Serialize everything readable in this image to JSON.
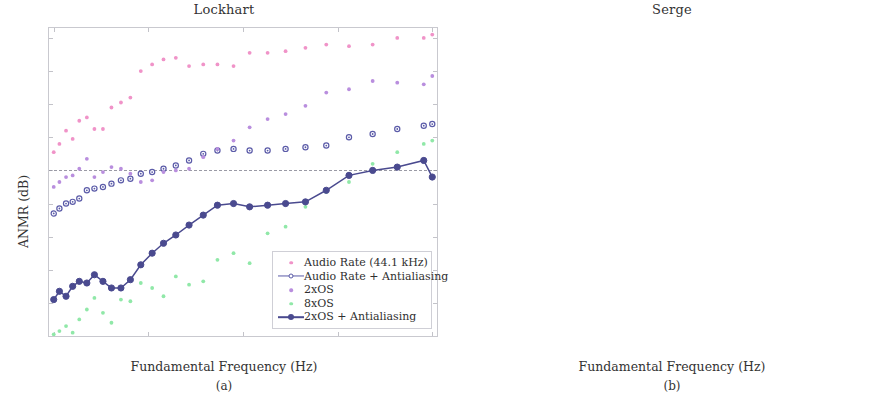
{
  "figure": {
    "panels": [
      {
        "id": "a",
        "title": "Lockhart",
        "subcaption": "(a)",
        "xlabel": "Fundamental Frequency (Hz)",
        "ylabel": "ANMR (dB)"
      },
      {
        "id": "b",
        "title": "Serge",
        "subcaption": "(b)",
        "xlabel": "Fundamental Frequency (Hz)",
        "ylabel": "ANMR (dB)"
      }
    ]
  },
  "colors": {
    "audio_rate": "#f093c8",
    "audio_rate_aa": "#5b5ba8",
    "os2": "#b98ede",
    "os8": "#90e8a8",
    "os2_aa": "#4a4a8f",
    "axis": "#c9c9cf",
    "refline": "#9a9aa5",
    "text": "#333333"
  },
  "chart_data": [
    {
      "type": "scatter",
      "title": "Lockhart",
      "subcaption": "(a)",
      "xlabel": "Fundamental Frequency (Hz)",
      "ylabel": "ANMR (dB)",
      "xlim": [
        950,
        5050
      ],
      "ylim": [
        -60,
        33
      ],
      "xticks": [
        1000,
        2000,
        3000,
        4000,
        5000
      ],
      "xticklabels": [
        "1k",
        "2k",
        "3k",
        "4k",
        "5k"
      ],
      "yticks": [
        -60,
        -50,
        -40,
        -30,
        -20,
        -10,
        0,
        10,
        20,
        30
      ],
      "yticklabels": [
        "-60",
        "-50",
        "-40",
        "-30",
        "-20",
        "-10",
        "0",
        "10",
        "20",
        "30"
      ],
      "grid": false,
      "reference_line": {
        "y": -10,
        "style": "dashed",
        "label": ""
      },
      "legend_position": "lower-right",
      "series": [
        {
          "name": "Audio Rate (44.1 kHz)",
          "marker": "dot",
          "line": false,
          "color": "#f093c8",
          "x": [
            1000,
            1060,
            1130,
            1200,
            1270,
            1350,
            1430,
            1520,
            1610,
            1710,
            1810,
            1920,
            2040,
            2160,
            2290,
            2430,
            2580,
            2730,
            2900,
            3070,
            3260,
            3450,
            3660,
            3880,
            4120,
            4370,
            4630,
            4910,
            5000
          ],
          "y": [
            -4.5,
            -2.0,
            2.0,
            -0.5,
            5.0,
            6.0,
            2.5,
            2.5,
            9.0,
            10.5,
            12.0,
            20.0,
            22.0,
            23.5,
            24.0,
            21.5,
            22.0,
            22.0,
            21.5,
            25.5,
            25.5,
            26.0,
            27.0,
            28.0,
            27.5,
            28.0,
            30.0,
            30.0,
            31.0
          ]
        },
        {
          "name": "Audio Rate + Antialiasing",
          "marker": "circle-open",
          "line": false,
          "color": "#5b5ba8",
          "x": [
            1000,
            1060,
            1130,
            1200,
            1270,
            1350,
            1430,
            1520,
            1610,
            1710,
            1810,
            1920,
            2040,
            2160,
            2290,
            2430,
            2580,
            2730,
            2900,
            3070,
            3260,
            3450,
            3660,
            3880,
            4120,
            4370,
            4630,
            4910,
            5000
          ],
          "y": [
            -23.0,
            -21.5,
            -20.0,
            -19.5,
            -18.5,
            -16.0,
            -15.5,
            -15.0,
            -14.0,
            -13.0,
            -12.5,
            -11.0,
            -10.5,
            -9.5,
            -8.5,
            -7.0,
            -5.0,
            -4.0,
            -3.5,
            -4.0,
            -4.0,
            -3.5,
            -3.0,
            -2.5,
            0.0,
            1.0,
            2.5,
            3.5,
            4.0
          ]
        },
        {
          "name": "2xOS",
          "marker": "dot",
          "line": false,
          "color": "#b98ede",
          "x": [
            1000,
            1060,
            1130,
            1200,
            1270,
            1350,
            1430,
            1520,
            1610,
            1710,
            1810,
            1920,
            2040,
            2160,
            2290,
            2430,
            2580,
            2730,
            2900,
            3070,
            3260,
            3450,
            3660,
            3880,
            4120,
            4370,
            4630,
            4910,
            5000
          ],
          "y": [
            -15.0,
            -13.5,
            -12.0,
            -11.5,
            -9.5,
            -6.5,
            -12.0,
            -10.5,
            -9.0,
            -9.5,
            -11.0,
            -13.5,
            -13.0,
            -10.5,
            -10.0,
            -9.5,
            -6.0,
            -3.5,
            -1.0,
            3.0,
            5.5,
            7.0,
            9.5,
            13.5,
            14.5,
            17.0,
            16.5,
            16.0,
            18.5
          ]
        },
        {
          "name": "8xOS",
          "marker": "dot",
          "line": false,
          "color": "#90e8a8",
          "x": [
            1000,
            1060,
            1130,
            1200,
            1270,
            1350,
            1430,
            1520,
            1610,
            1710,
            1810,
            1920,
            2040,
            2160,
            2290,
            2430,
            2580,
            2730,
            2900,
            3070,
            3260,
            3450,
            3660,
            3880,
            4120,
            4370,
            4630,
            4910,
            5000
          ],
          "y": [
            -59.5,
            -58.5,
            -57.0,
            -59.0,
            -55.0,
            -52.0,
            -48.5,
            -53.0,
            -56.0,
            -49.0,
            -49.5,
            -44.0,
            -45.5,
            -48.0,
            -42.0,
            -44.5,
            -43.5,
            -37.0,
            -35.0,
            -38.0,
            -29.0,
            -27.0,
            -21.0,
            -16.5,
            -13.5,
            -8.0,
            -4.5,
            -2.0,
            -1.0
          ]
        },
        {
          "name": "2xOS + Antialiasing",
          "marker": "circle-filled",
          "line": true,
          "color": "#4a4a8f",
          "x": [
            1000,
            1060,
            1130,
            1200,
            1270,
            1350,
            1430,
            1520,
            1610,
            1710,
            1810,
            1920,
            2040,
            2160,
            2290,
            2430,
            2580,
            2730,
            2900,
            3070,
            3260,
            3450,
            3660,
            3880,
            4120,
            4370,
            4630,
            4910,
            5000
          ],
          "y": [
            -49.0,
            -46.5,
            -48.0,
            -45.0,
            -43.5,
            -44.0,
            -41.5,
            -43.5,
            -45.5,
            -45.5,
            -43.0,
            -38.5,
            -35.0,
            -32.0,
            -29.5,
            -26.5,
            -23.5,
            -20.5,
            -20.0,
            -21.0,
            -20.5,
            -20.0,
            -19.5,
            -16.0,
            -11.5,
            -10.0,
            -9.0,
            -7.0,
            -12.0
          ]
        }
      ]
    },
    {
      "type": "scatter",
      "title": "Serge",
      "subcaption": "(b)",
      "xlabel": "Fundamental Frequency (Hz)",
      "ylabel": "ANMR (dB)",
      "xlim": [
        950,
        5050
      ],
      "ylim": [
        -60,
        33
      ],
      "xticks": [
        1000,
        2000,
        3000,
        4000,
        5000
      ],
      "xticklabels": [
        "1k",
        "2k",
        "3k",
        "4k",
        "5k"
      ],
      "yticks": [
        -60,
        -50,
        -40,
        -30,
        -20,
        -10,
        0,
        10,
        20,
        30
      ],
      "yticklabels": [
        "-60",
        "-50",
        "-40",
        "-30",
        "-20",
        "-10",
        "0",
        "10",
        "20",
        "30"
      ],
      "grid": false,
      "reference_line": {
        "y": -10,
        "style": "dashed",
        "label": ""
      },
      "legend_position": "lower-right",
      "series": [
        {
          "name": "Audio Rate",
          "marker": "dot",
          "line": false,
          "color": "#f093c8",
          "x": [
            1000,
            1060,
            1130,
            1200,
            1270,
            1350,
            1430,
            1520,
            1610,
            1710,
            1810,
            1920,
            2040,
            2160,
            2290,
            2430,
            2580,
            2730,
            2900,
            3070,
            3260,
            3450,
            3660,
            3880,
            4120,
            4370,
            4630,
            4910,
            5000
          ],
          "y": [
            -45.0,
            -40.5,
            -37.0,
            -37.5,
            -39.0,
            -40.0,
            -35.5,
            -28.0,
            -22.5,
            -25.5,
            -24.5,
            -19.5,
            -21.5,
            -20.0,
            -17.0,
            -11.0,
            -10.0,
            -6.5,
            -4.0,
            1.0,
            1.0,
            2.0,
            3.0,
            4.0,
            3.5,
            6.5,
            6.5,
            1.5,
            15.5
          ]
        },
        {
          "name": "Audio Rate + Antialiasing",
          "marker": "circle-open",
          "line": true,
          "color": "#5b5ba8",
          "x": [
            1000,
            1060,
            1130,
            1200,
            1270,
            1350,
            1430,
            1520,
            1610,
            1710,
            1810,
            1920,
            2040,
            2160,
            2290,
            2430,
            2580,
            2730,
            2900,
            3070,
            3260,
            3450,
            3660,
            3880,
            4120,
            4370,
            4630,
            4910,
            5000
          ],
          "y": [
            -60.0,
            -57.0,
            -54.0,
            -53.5,
            -52.5,
            -52.0,
            -50.0,
            -47.0,
            -45.0,
            -42.0,
            -39.5,
            -39.0,
            -37.5,
            -37.0,
            -37.5,
            -34.0,
            -33.5,
            -28.5,
            -27.0,
            -25.0,
            -22.5,
            -19.0,
            -18.5,
            -17.5,
            -17.5,
            -18.5,
            -17.5,
            -15.5,
            -15.0
          ]
        },
        {
          "name": "2xOS",
          "marker": "dot",
          "line": true,
          "color": "#b98ede",
          "x": [
            1000,
            1060,
            1130,
            1200,
            1270,
            1350,
            1430,
            1520,
            1610,
            1710,
            1810,
            1920,
            2040,
            2160,
            2290,
            2430,
            2580,
            2730,
            2900,
            3070,
            3260,
            3450,
            3660,
            3880,
            4120,
            4370,
            4630,
            4910,
            5000
          ],
          "y": [
            -51.5,
            -50.5,
            -51.5,
            -52.0,
            -51.5,
            -50.0,
            -49.5,
            -47.0,
            -46.0,
            -45.5,
            -46.5,
            -43.5,
            -39.0,
            -42.0,
            -40.5,
            -37.5,
            -41.0,
            -37.0,
            -31.0,
            -24.0,
            -24.5,
            -23.5,
            -18.5,
            -20.0,
            -22.5,
            -19.5,
            -16.0,
            -15.5,
            -0.5
          ]
        }
      ]
    }
  ],
  "legends": {
    "a": {
      "entries": [
        {
          "label": "Audio Rate (44.1 kHz)",
          "color": "#f093c8",
          "marker": "dot",
          "line": false
        },
        {
          "label": "Audio Rate + Antialiasing",
          "color": "#5b5ba8",
          "marker": "circle-open",
          "line": true
        },
        {
          "label": "2xOS",
          "color": "#b98ede",
          "marker": "dot",
          "line": false
        },
        {
          "label": "8xOS",
          "color": "#90e8a8",
          "marker": "dot",
          "line": false
        },
        {
          "label": "2xOS + Antialiasing",
          "color": "#4a4a8f",
          "marker": "circle-filled",
          "line": true
        }
      ]
    },
    "b": {
      "entries": [
        {
          "label": "Audio Rate",
          "color": "#f093c8",
          "marker": "dot",
          "line": false
        },
        {
          "label": "Audio Rate + Antialiasing",
          "color": "#5b5ba8",
          "marker": "circle-open",
          "line": true
        },
        {
          "label": "2xOS",
          "color": "#b98ede",
          "marker": "dot",
          "line": true
        }
      ]
    }
  }
}
